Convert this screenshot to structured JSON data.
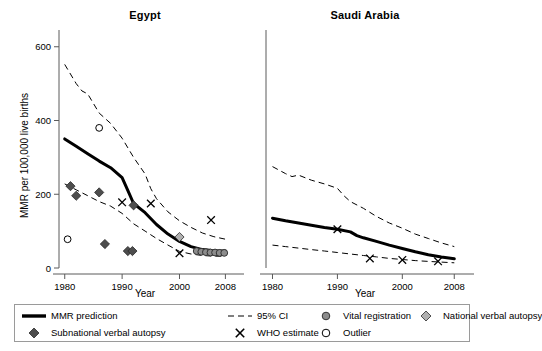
{
  "axis": {
    "ylabel": "MMR per 100,000 live births",
    "xlabel": "Year",
    "yticks": [
      0,
      200,
      400,
      600
    ],
    "xticks": [
      1980,
      1990,
      2000,
      2008
    ],
    "ylim": [
      0,
      640
    ],
    "xlim": [
      1979,
      2009.5
    ]
  },
  "legend": {
    "items": [
      {
        "symbol": "thick-line",
        "label": "MMR prediction",
        "color": "#000000"
      },
      {
        "symbol": "dashed-line",
        "label": "95% CI",
        "color": "#000000"
      },
      {
        "symbol": "circle-filled",
        "label": "Vital registration",
        "color": "#8c8c8c"
      },
      {
        "symbol": "diamond-light",
        "label": "National verbal autopsy",
        "color": "#b0b0b0"
      },
      {
        "symbol": "diamond-dark",
        "label": "Subnational verbal autopsy",
        "color": "#4d4d4d"
      },
      {
        "symbol": "cross",
        "label": "WHO estimate",
        "color": "#000000"
      },
      {
        "symbol": "circle-open",
        "label": "Outlier",
        "color": "#000000"
      }
    ]
  },
  "chart_data": {
    "type": "line",
    "title": "",
    "xlabel": "Year",
    "ylabel": "MMR per 100,000 live births",
    "ylim": [
      0,
      640
    ],
    "xlim": [
      1979,
      2009.5
    ],
    "grid": false,
    "legend_position": "bottom",
    "panels": [
      {
        "name": "Egypt",
        "series": [
          {
            "name": "MMR prediction",
            "style": "solid-thick",
            "x": [
              1980,
              1982,
              1984,
              1986,
              1988,
              1990,
              1991,
              1992,
              1994,
              1996,
              1998,
              2000,
              2002,
              2004,
              2006,
              2008
            ],
            "y": [
              350,
              330,
              310,
              290,
              272,
              245,
              210,
              175,
              150,
              118,
              92,
              72,
              58,
              50,
              47,
              46
            ]
          },
          {
            "name": "95% CI upper",
            "style": "dashed",
            "x": [
              1980,
              1982,
              1983,
              1984,
              1986,
              1988,
              1990,
              1992,
              1994,
              1995,
              1996,
              1998,
              2000,
              2002,
              2004,
              2006,
              2008
            ],
            "y": [
              552,
              500,
              480,
              472,
              420,
              392,
              352,
              300,
              255,
              215,
              188,
              152,
              128,
              110,
              95,
              85,
              78
            ]
          },
          {
            "name": "95% CI lower",
            "style": "dashed",
            "x": [
              1980,
              1982,
              1984,
              1986,
              1988,
              1990,
              1992,
              1994,
              1996,
              1998,
              2000,
              2002,
              2004,
              2006,
              2008
            ],
            "y": [
              228,
              212,
              196,
              180,
              168,
              148,
              120,
              100,
              80,
              62,
              45,
              38,
              34,
              32,
              32
            ]
          }
        ],
        "points": [
          {
            "type": "diamond-dark",
            "x": 1981,
            "y": 222
          },
          {
            "type": "diamond-dark",
            "x": 1982,
            "y": 196
          },
          {
            "type": "diamond-dark",
            "x": 1986,
            "y": 205
          },
          {
            "type": "diamond-dark",
            "x": 1987,
            "y": 65
          },
          {
            "type": "diamond-dark",
            "x": 1991,
            "y": 46
          },
          {
            "type": "diamond-dark",
            "x": 1991.8,
            "y": 46
          },
          {
            "type": "diamond-dark",
            "x": 1992,
            "y": 170
          },
          {
            "type": "circle-open",
            "x": 1980.5,
            "y": 78
          },
          {
            "type": "circle-open",
            "x": 1986,
            "y": 380
          },
          {
            "type": "cross",
            "x": 1990,
            "y": 178
          },
          {
            "type": "cross",
            "x": 1995,
            "y": 175
          },
          {
            "type": "cross",
            "x": 2000,
            "y": 40
          },
          {
            "type": "cross",
            "x": 2005.5,
            "y": 130
          },
          {
            "type": "diamond-light",
            "x": 2000,
            "y": 84
          },
          {
            "type": "circle-filled",
            "x": 2003,
            "y": 46
          },
          {
            "type": "circle-filled",
            "x": 2003.8,
            "y": 44
          },
          {
            "type": "circle-filled",
            "x": 2004.6,
            "y": 43
          },
          {
            "type": "circle-filled",
            "x": 2005.4,
            "y": 42
          },
          {
            "type": "circle-filled",
            "x": 2006.2,
            "y": 42
          },
          {
            "type": "circle-filled",
            "x": 2007,
            "y": 41
          },
          {
            "type": "circle-filled",
            "x": 2007.8,
            "y": 41
          }
        ]
      },
      {
        "name": "Saudi Arabia",
        "series": [
          {
            "name": "MMR prediction",
            "style": "solid-thick",
            "x": [
              1980,
              1982,
              1984,
              1986,
              1988,
              1990,
              1992,
              1993,
              1994,
              1996,
              1998,
              2000,
              2002,
              2004,
              2006,
              2008
            ],
            "y": [
              135,
              128,
              122,
              116,
              110,
              105,
              98,
              88,
              82,
              72,
              62,
              53,
              44,
              36,
              30,
              25
            ]
          },
          {
            "name": "95% CI upper",
            "style": "dashed",
            "x": [
              1980,
              1982,
              1983,
              1984,
              1986,
              1988,
              1990,
              1991,
              1992,
              1994,
              1996,
              1998,
              2000,
              2002,
              2004,
              2006,
              2008
            ],
            "y": [
              275,
              256,
              248,
              252,
              238,
              228,
              216,
              196,
              180,
              162,
              140,
              122,
              108,
              92,
              80,
              68,
              58
            ]
          },
          {
            "name": "95% CI lower",
            "style": "dashed",
            "x": [
              1980,
              1982,
              1984,
              1986,
              1988,
              1990,
              1992,
              1994,
              1996,
              1998,
              2000,
              2002,
              2004,
              2006,
              2008
            ],
            "y": [
              62,
              58,
              54,
              50,
              46,
              42,
              38,
              34,
              30,
              26,
              23,
              20,
              18,
              16,
              14
            ]
          }
        ],
        "points": [
          {
            "type": "cross",
            "x": 1990,
            "y": 105
          },
          {
            "type": "cross",
            "x": 1995,
            "y": 26
          },
          {
            "type": "cross",
            "x": 2000,
            "y": 22
          },
          {
            "type": "cross",
            "x": 2005.5,
            "y": 18
          }
        ]
      }
    ]
  }
}
